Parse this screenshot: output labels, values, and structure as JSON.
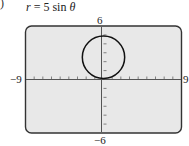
{
  "corner_label": ")",
  "title": {
    "lhs": "r",
    "eq": " = 5 sin ",
    "theta": "θ"
  },
  "axis_labels": {
    "ymax": "6",
    "ymin": "−6",
    "xmin": "−9",
    "xmax": "9"
  },
  "colors": {
    "screen_bg": "#e8e8e8",
    "frame": "#333333",
    "curve": "#111111",
    "axis": "#555555"
  },
  "chart_data": {
    "type": "line",
    "title": "r = 5 sin θ",
    "subtype": "polar",
    "equation": "r = 5 sin θ",
    "xlim": [
      -9,
      9
    ],
    "ylim": [
      -6,
      6
    ],
    "xscale": 1,
    "yscale": 1,
    "grid": false,
    "xlabel": "",
    "ylabel": "",
    "tick_labels": {
      "x": [
        "−9",
        "9"
      ],
      "y": [
        "−6",
        "6"
      ]
    },
    "circle": {
      "center": [
        0,
        2.5
      ],
      "radius": 2.5
    }
  }
}
